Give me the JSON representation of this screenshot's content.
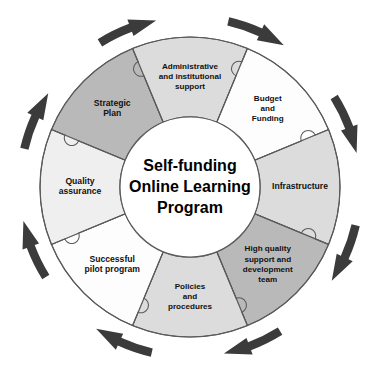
{
  "diagram": {
    "center": {
      "lines": [
        "Self-funding",
        "Online Learning",
        "Program"
      ]
    },
    "geometry": {
      "cx": 190,
      "cy": 187,
      "outer_radius": 150,
      "inner_radius": 70,
      "segment_count": 8,
      "rotation_note": "segments start at top, arranged clockwise"
    },
    "colors": {
      "dark_fill": "#b9b9b9",
      "mid_fill": "#dcdcdc",
      "light_fill": "#efefef",
      "white_fill": "#fdfdfd",
      "stroke": "#5a5a5a",
      "arrow": "#3b3b3b",
      "text": "#111111",
      "background": "#ffffff"
    },
    "segments": [
      {
        "id": "strategic-plan",
        "index": 0,
        "lines": [
          "Strategic",
          "Plan"
        ],
        "fill": "#b9b9b9",
        "shade": "dark",
        "start_angle": -67.5,
        "end_angle": -22.5
      },
      {
        "id": "administrative-and-institutional-support",
        "index": 1,
        "lines": [
          "Administrative",
          "and institutional",
          "support"
        ],
        "fill": "#dcdcdc",
        "shade": "mid",
        "start_angle": -22.5,
        "end_angle": 22.5
      },
      {
        "id": "budget-and-funding",
        "index": 2,
        "lines": [
          "Budget",
          "and",
          "Funding"
        ],
        "fill": "#fdfdfd",
        "shade": "white",
        "start_angle": 22.5,
        "end_angle": 67.5
      },
      {
        "id": "infrastructure",
        "index": 3,
        "lines": [
          "Infrastructure"
        ],
        "fill": "#dcdcdc",
        "shade": "mid",
        "start_angle": 67.5,
        "end_angle": 112.5
      },
      {
        "id": "high-quality-support-and-development-team",
        "index": 4,
        "lines": [
          "High quality",
          "support and",
          "development",
          "team"
        ],
        "fill": "#b9b9b9",
        "shade": "dark",
        "start_angle": 112.5,
        "end_angle": 157.5
      },
      {
        "id": "policies-and-procedures",
        "index": 5,
        "lines": [
          "Policies",
          "and",
          "procedures"
        ],
        "fill": "#dcdcdc",
        "shade": "mid",
        "start_angle": 157.5,
        "end_angle": 202.5
      },
      {
        "id": "successful-pilot-program",
        "index": 6,
        "lines": [
          "Successful",
          "pilot program"
        ],
        "fill": "#fdfdfd",
        "shade": "white",
        "start_angle": 202.5,
        "end_angle": 247.5
      },
      {
        "id": "quality-assurance",
        "index": 7,
        "lines": [
          "Quality",
          "assurance"
        ],
        "fill": "#efefef",
        "shade": "light",
        "start_angle": 247.5,
        "end_angle": 292.5
      }
    ],
    "arrows": {
      "count": 8,
      "direction": "clockwise",
      "color": "#3b3b3b",
      "angles_deg": [
        -67.5,
        -22.5,
        22.5,
        67.5,
        112.5,
        157.5,
        202.5,
        247.5
      ]
    }
  }
}
